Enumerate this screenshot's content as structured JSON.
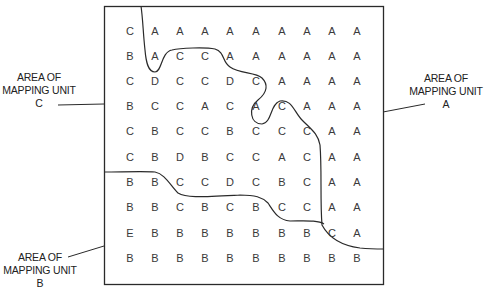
{
  "figure": {
    "grid": {
      "rows": [
        [
          "C",
          "A",
          "A",
          "A",
          "A",
          "A",
          "A",
          "A",
          "A",
          "A"
        ],
        [
          "B",
          "A",
          "C",
          "C",
          "A",
          "A",
          "A",
          "A",
          "A",
          "A"
        ],
        [
          "C",
          "D",
          "C",
          "C",
          "D",
          "C",
          "A",
          "A",
          "A",
          "A"
        ],
        [
          "B",
          "C",
          "C",
          "A",
          "C",
          "A",
          "C",
          "A",
          "A",
          "A"
        ],
        [
          "C",
          "B",
          "C",
          "C",
          "B",
          "C",
          "C",
          "C",
          "A",
          "A"
        ],
        [
          "C",
          "B",
          "D",
          "B",
          "C",
          "C",
          "A",
          "C",
          "A",
          "A"
        ],
        [
          "B",
          "B",
          "C",
          "C",
          "D",
          "C",
          "B",
          "C",
          "A",
          "A"
        ],
        [
          "B",
          "B",
          "C",
          "B",
          "C",
          "B",
          "C",
          "C",
          "A",
          "A"
        ],
        [
          "E",
          "B",
          "B",
          "B",
          "B",
          "B",
          "B",
          "B",
          "C",
          "A"
        ],
        [
          "B",
          "B",
          "B",
          "B",
          "B",
          "B",
          "B",
          "B",
          "B",
          "B"
        ]
      ]
    },
    "labels": {
      "unit_c": {
        "line1": "AREA OF",
        "line2": "MAPPING UNIT",
        "line3": "C"
      },
      "unit_a": {
        "line1": "AREA OF",
        "line2": "MAPPING UNIT",
        "line3": "A"
      },
      "unit_b": {
        "line1": "AREA OF",
        "line2": "MAPPING UNIT",
        "line3": "B"
      }
    },
    "colors": {
      "ink": "#2a2a2a",
      "background": "#ffffff"
    }
  }
}
